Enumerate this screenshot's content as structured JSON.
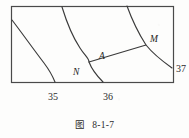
{
  "figure": {
    "caption_label": "图",
    "caption_number": "8-1-7",
    "frame": {
      "x": 11,
      "y": 6,
      "width": 162,
      "height": 76,
      "stroke_color": "#4a4a4a"
    },
    "curve_color": "#3a3a3a",
    "background_color": "#fdfdfc",
    "contours": [
      {
        "name": "contour-35",
        "value_label": "35",
        "label_x": 48,
        "label_y": 92,
        "path": "M 12,20 C 22,33 34,50 44,63 C 50,71 53,77 55,82"
      },
      {
        "name": "contour-36",
        "value_label": "36",
        "label_x": 103,
        "label_y": 92,
        "path": "M 62,7 C 66,20 72,36 80,48 C 85,56 89,58 89,62 C 92,70 98,77 103,82"
      },
      {
        "name": "contour-37",
        "value_label": "37",
        "label_x": 176,
        "label_y": 64,
        "path": "M 127,6 C 131,17 137,31 146,45 C 154,55 165,63 172,68"
      }
    ],
    "segment": {
      "name": "segment-AM",
      "from": {
        "x": 89,
        "y": 62
      },
      "to": {
        "x": 146,
        "y": 45
      }
    },
    "points": [
      {
        "id": "A",
        "label": "A",
        "label_x": 99,
        "label_y": 52,
        "x": 89,
        "y": 62
      },
      {
        "id": "M",
        "label": "M",
        "label_x": 150,
        "label_y": 35,
        "x": 146,
        "y": 45
      },
      {
        "id": "N",
        "label": "N",
        "label_x": 73,
        "label_y": 68,
        "x": 80,
        "y": 82
      }
    ]
  }
}
